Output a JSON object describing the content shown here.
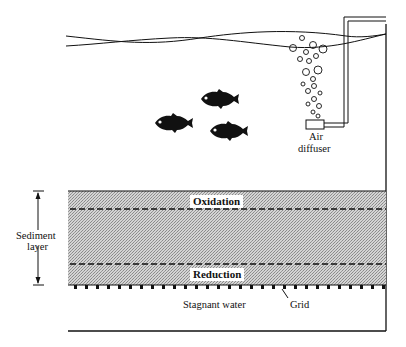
{
  "figure": {
    "type": "aquarium sediment cross-section diagram",
    "labels": {
      "air_diffuser_line1": "Air",
      "air_diffuser_line2": "diffuser",
      "sediment_line1": "Sediment",
      "sediment_line2": "layer",
      "oxidation": "Oxidation",
      "reduction": "Reduction",
      "stagnant_water": "Stagnant water",
      "grid": "Grid"
    },
    "colors": {
      "ink": "#111111",
      "sediment_fill": "#c8c8c8",
      "background": "#ffffff"
    },
    "fish_count": 3
  }
}
